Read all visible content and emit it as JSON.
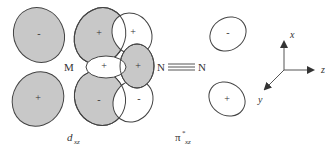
{
  "diagram": {
    "type": "molecular-orbital-backbonding",
    "colors": {
      "shaded": "#c8c8c8",
      "outline": "#444444",
      "white": "#ffffff",
      "text": "#333333"
    },
    "left_panel": {
      "metal_label": "M",
      "orbital_label_main": "d",
      "orbital_label_sub": "xz",
      "lobes": [
        {
          "id": "dxz-top-left",
          "sign": "-",
          "shaded": true
        },
        {
          "id": "dxz-bottom-left",
          "sign": "+",
          "shaded": true
        },
        {
          "id": "dxz-top-right",
          "sign": "+",
          "shaded": true
        },
        {
          "id": "dxz-bottom-right",
          "sign": "-",
          "shaded": true
        },
        {
          "id": "pi-top",
          "sign": "+",
          "shaded": false
        },
        {
          "id": "pi-bottom",
          "sign": "-",
          "shaded": false
        },
        {
          "id": "sigma-white",
          "sign": "+",
          "shaded": false
        },
        {
          "id": "sigma-shaded",
          "sign": "+",
          "shaded": true
        }
      ],
      "ligand_label": "N"
    },
    "middle": {
      "n1": "N",
      "n2": "N",
      "bond": "triple"
    },
    "right_panel": {
      "orbital_label_main": "π",
      "orbital_label_sup": "*",
      "orbital_label_sub": "xz",
      "lobes": [
        {
          "id": "pi-star-top",
          "sign": "-"
        },
        {
          "id": "pi-star-bottom",
          "sign": "+"
        }
      ]
    },
    "axes": {
      "x": "x",
      "y": "y",
      "z": "z"
    }
  }
}
